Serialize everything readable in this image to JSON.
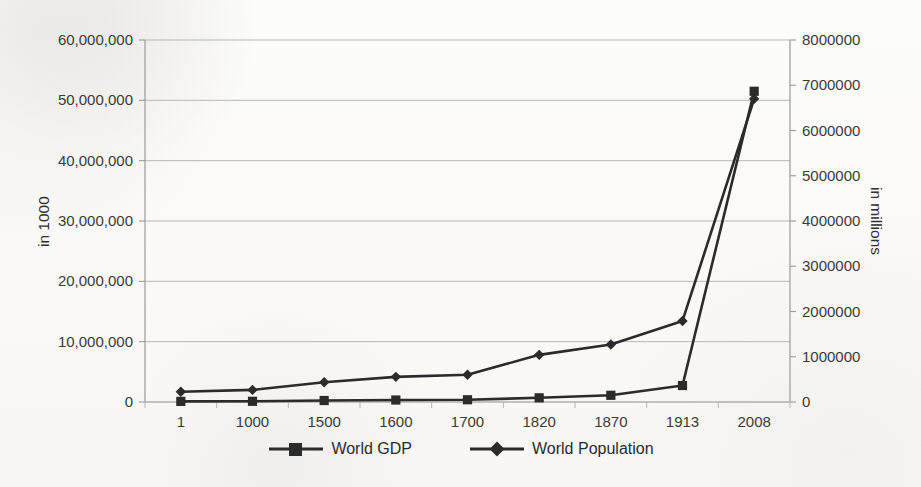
{
  "chart_data": {
    "type": "line",
    "title": "",
    "categories": [
      "1",
      "1000",
      "1500",
      "1600",
      "1700",
      "1820",
      "1870",
      "1913",
      "2008"
    ],
    "xlabel": "",
    "series": [
      {
        "name": "World GDP",
        "axis": "left",
        "unit": "in 1000",
        "marker": "square",
        "color": "#2b2b2b",
        "values": [
          102500,
          116800,
          247100,
          329400,
          371000,
          694400,
          1111000,
          2733000,
          51500000
        ]
      },
      {
        "name": "World Population",
        "axis": "right",
        "unit": "in millions",
        "marker": "diamond",
        "color": "#2b2b2b",
        "values": [
          226000,
          267000,
          438000,
          556000,
          603000,
          1042000,
          1272000,
          1791000,
          6700000
        ]
      }
    ],
    "left_axis": {
      "label": "in 1000",
      "min": 0,
      "max": 60000000,
      "step": 10000000,
      "ticks": [
        "0",
        "10,000,000",
        "20,000,000",
        "30,000,000",
        "40,000,000",
        "50,000,000",
        "60,000,000"
      ]
    },
    "right_axis": {
      "label": "in millions",
      "min": 0,
      "max": 8000000,
      "step": 1000000,
      "ticks": [
        "0",
        "1000000",
        "2000000",
        "3000000",
        "4000000",
        "5000000",
        "6000000",
        "7000000",
        "8000000"
      ]
    },
    "grid": {
      "horizontal": true,
      "vertical": false,
      "follows_axis": "left"
    },
    "legend": {
      "position": "bottom",
      "entries": [
        "World GDP",
        "World Population"
      ]
    },
    "colors": {
      "line": "#2b2b2b",
      "grid": "#b7b7b7",
      "axis": "#8d8d8d",
      "text": "#3a3a3a",
      "background": "#fbfbf9"
    }
  }
}
